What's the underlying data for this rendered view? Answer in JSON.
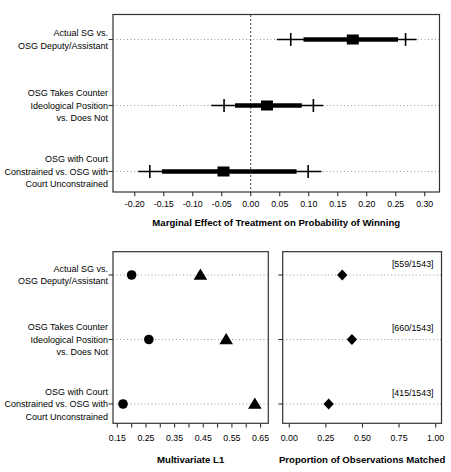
{
  "colors": {
    "foreground": "#000000",
    "frame": "#333333",
    "grid": "#9a9a9a",
    "zero_line": "#444444",
    "background": "#ffffff"
  },
  "categories": [
    [
      "Actual SG vs.",
      "OSG Deputy/Assistant"
    ],
    [
      "OSG Takes Counter",
      "Ideological Position",
      "vs. Does Not"
    ],
    [
      "OSG with Court",
      "Constrained vs. OSG with",
      "Court Unconstrained"
    ]
  ],
  "chart_data": [
    {
      "id": "marginal-effects",
      "type": "scatter",
      "subtype": "interval-estimate-plot",
      "title": "",
      "xlabel": "Marginal Effect of Treatment on Probability of Winning",
      "ylabel": "",
      "xlim": [
        -0.2375,
        0.3255
      ],
      "xticks": [
        -0.2,
        -0.15,
        -0.1,
        -0.05,
        0.0,
        0.05,
        0.1,
        0.15,
        0.2,
        0.25,
        0.3
      ],
      "xtick_labels": [
        "-0.20",
        "-0.15",
        "-0.10",
        "-0.05",
        "0.00",
        "0.05",
        "0.10",
        "0.15",
        "0.20",
        "0.25",
        "0.30"
      ],
      "zero_reference_line": 0.0,
      "grid": "dotted-horizontal",
      "rows": [
        {
          "category_index": 0,
          "estimate": 0.176,
          "thick_interval": [
            0.091,
            0.254
          ],
          "cross_marks": [
            0.069,
            0.267
          ],
          "outer_interval": [
            0.045,
            0.286
          ]
        },
        {
          "category_index": 1,
          "estimate": 0.028,
          "thick_interval": [
            -0.027,
            0.088
          ],
          "cross_marks": [
            -0.046,
            0.108
          ],
          "outer_interval": [
            -0.068,
            0.125
          ]
        },
        {
          "category_index": 2,
          "estimate": -0.047,
          "thick_interval": [
            -0.153,
            0.079
          ],
          "cross_marks": [
            -0.174,
            0.099
          ],
          "outer_interval": [
            -0.194,
            0.122
          ]
        }
      ]
    },
    {
      "id": "multivariate-l1",
      "type": "scatter",
      "title": "",
      "xlabel": "Multivariate L1",
      "ylabel": "",
      "xlim": [
        0.135,
        0.677
      ],
      "xticks": [
        0.15,
        0.25,
        0.35,
        0.45,
        0.55,
        0.65
      ],
      "xtick_labels": [
        "0.15",
        "0.25",
        "0.35",
        "0.45",
        "0.55",
        "0.65"
      ],
      "xticks_minor": [
        0.2,
        0.3,
        0.4,
        0.5,
        0.6
      ],
      "grid": "dotted-horizontal",
      "series": [
        {
          "name": "circle-series",
          "marker": "circle",
          "values": [
            0.2,
            0.26,
            0.17
          ]
        },
        {
          "name": "triangle-series",
          "marker": "triangle",
          "values": [
            0.44,
            0.53,
            0.63
          ]
        }
      ]
    },
    {
      "id": "proportion-matched",
      "type": "scatter",
      "title": "",
      "xlabel": "Proportion of Observations Matched",
      "ylabel": "",
      "xlim": [
        -0.045,
        1.04
      ],
      "xticks": [
        0.0,
        0.25,
        0.5,
        0.75,
        1.0
      ],
      "xtick_labels": [
        "0.00",
        "0.25",
        "0.50",
        "0.75",
        "1.00"
      ],
      "grid": "dotted-horizontal",
      "series": [
        {
          "name": "diamond-series",
          "marker": "diamond",
          "values": [
            0.362,
            0.428,
            0.269
          ]
        }
      ],
      "annotations": [
        {
          "text": "[559/1543]",
          "row": 0
        },
        {
          "text": "[660/1543]",
          "row": 1
        },
        {
          "text": "[415/1543]",
          "row": 2
        }
      ]
    }
  ]
}
